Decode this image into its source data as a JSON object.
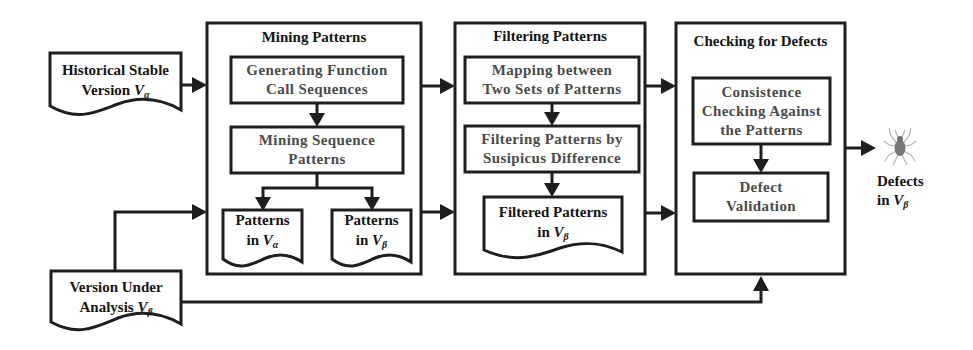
{
  "colors": {
    "stroke": "#1e1e1e",
    "title_text": "#141414",
    "step_text": "#4a4a4a",
    "bug_body": "#7a7a7a",
    "bug_legs": "#b8b8b8",
    "background": "#ffffff"
  },
  "inputs": {
    "historical": {
      "line1": "Historical Stable",
      "line2_prefix": "Version ",
      "var": "V",
      "sub": "α"
    },
    "under_analysis": {
      "line1": "Version Under",
      "line2_prefix": "Analysis ",
      "var": "V",
      "sub": "β"
    }
  },
  "stages": {
    "mining": {
      "title": "Mining Patterns",
      "steps": [
        {
          "line1": "Generating Function",
          "line2": "Call Sequences"
        },
        {
          "line1": "Mining Sequence",
          "line2": "Patterns"
        }
      ],
      "outputs": [
        {
          "line1": "Patterns",
          "line2_prefix": "in ",
          "var": "V",
          "sub": "α"
        },
        {
          "line1": "Patterns",
          "line2_prefix": "in ",
          "var": "V",
          "sub": "β"
        }
      ]
    },
    "filtering": {
      "title": "Filtering Patterns",
      "steps": [
        {
          "line1": "Mapping between",
          "line2": "Two Sets of Patterns"
        },
        {
          "line1": "Filtering Patterns by",
          "line2": "Susipicus Difference"
        }
      ],
      "outputs": [
        {
          "line1": "Filtered Patterns",
          "line2_prefix": "in ",
          "var": "V",
          "sub": "β"
        }
      ]
    },
    "checking": {
      "title": "Checking for Defects",
      "steps": [
        {
          "line1": "Consistence",
          "line2": "Checking Against",
          "line3": "the Patterns"
        },
        {
          "line1": "Defect",
          "line2": "Validation"
        }
      ]
    }
  },
  "output": {
    "icon": "bug-icon",
    "line1": "Defects",
    "line2_prefix": "in ",
    "var": "V",
    "sub": "β"
  }
}
